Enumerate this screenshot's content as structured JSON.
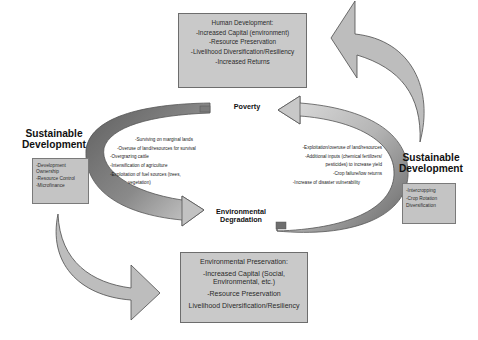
{
  "top_box": {
    "heading": "Human Development:",
    "items": [
      "-Increased Capital (environment)",
      "-Resource Preservation",
      "-Livelihood Diversification/Resiliency",
      "-Increased Returns"
    ]
  },
  "bottom_box": {
    "heading": "Environmental Preservation:",
    "items": [
      "-Increased Capital (Social,",
      "Environmental, etc.)",
      "-Resource Preservation",
      "Livelihood Diversification/Resiliency"
    ]
  },
  "left_side": {
    "title_line1": "Sustainable",
    "title_line2": "Development",
    "items": [
      "-Development",
      "Ownership",
      "-Resource Control",
      "-Microfinance"
    ]
  },
  "right_side": {
    "title_line1": "Sustainable",
    "title_line2": "Development",
    "items": [
      "-Intercropping",
      "-Crop Rotation",
      "Diversification"
    ]
  },
  "nodes": {
    "poverty": "Poverty",
    "env_line1": "Environmental",
    "env_line2": "Degradation"
  },
  "left_cycle_list": {
    "items": [
      "-Surviving on marginal lands",
      "-Overuse of land/resources for survival",
      "-Overgrazing cattle",
      "-Intensification of agriculture",
      "-Exploitation of fuel sources (trees,",
      "vegetation)"
    ]
  },
  "right_cycle_list": {
    "items": [
      "-Exploitation/overuse of land/resources",
      "-Additional inputs (chemical fertilizers/",
      "pesticides) to increase yield",
      "-Crop failure/low returns",
      "-Increase of disaster vulnerability"
    ]
  },
  "colors": {
    "arrow_fill": "#bdbdbd",
    "arrow_dark": "#6e6e6e",
    "box_fill": "#c9c9c9",
    "outline": "#555555"
  }
}
